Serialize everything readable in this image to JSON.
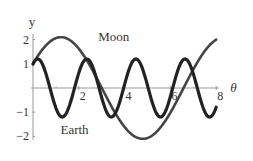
{
  "chart_data": {
    "type": "line",
    "title": "",
    "xlabel": "θ",
    "ylabel": "y",
    "xlim": [
      0,
      8
    ],
    "ylim": [
      -2.3,
      2.4
    ],
    "grid": false,
    "x_ticks": [
      2,
      4,
      6,
      8
    ],
    "x_tick_labels": [
      "2",
      "4",
      "6",
      "8"
    ],
    "y_ticks": [
      2,
      1,
      -1,
      -2
    ],
    "y_tick_labels": [
      "2",
      "1",
      "−1",
      "−2"
    ],
    "series": [
      {
        "name": "Moon",
        "label": "Moon",
        "color": "#444444",
        "function": "2.1*sin(0.88*θ + 0.497)",
        "x": [
          0,
          0.5,
          1,
          1.1,
          1.5,
          2,
          2.5,
          3,
          3.5,
          4,
          4.67,
          5,
          5.5,
          6,
          6.5,
          7,
          7.5,
          8
        ],
        "y": [
          1.0,
          1.6,
          2.0,
          2.1,
          2.0,
          1.7,
          1.2,
          0.6,
          -0.1,
          -0.8,
          -2.1,
          -2.0,
          -1.8,
          -1.3,
          -0.7,
          0.0,
          0.7,
          1.4
        ]
      },
      {
        "name": "Earth",
        "label": "Earth",
        "color": "#222222",
        "function": "1.2*cos(2.93*θ - 0.6)",
        "x": [
          0,
          0.2,
          1.27,
          2.27,
          3.36,
          4.37,
          5.46,
          6.5,
          7.6,
          8
        ],
        "y": [
          1.0,
          1.2,
          -1.2,
          1.2,
          -1.2,
          1.2,
          -1.2,
          1.2,
          -1.2,
          -0.5
        ]
      }
    ]
  }
}
